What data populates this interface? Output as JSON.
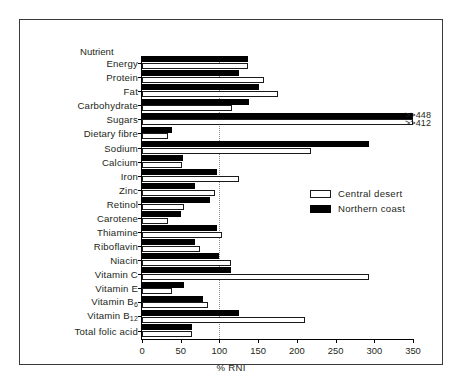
{
  "chart_data": {
    "type": "bar",
    "orientation": "horizontal",
    "title": "",
    "xlabel": "% RNI",
    "ylabel": "Nutrient",
    "xlim": [
      0,
      350
    ],
    "xticks": [
      0,
      50,
      100,
      150,
      200,
      250,
      300,
      350
    ],
    "grid": "vertical dotted reference line at 100",
    "reference_line": 100,
    "legend_position": "middle-right",
    "categories": [
      "Energy",
      "Protein",
      "Fat",
      "Carbohydrate",
      "Sugars",
      "Dietary fibre",
      "Sodium",
      "Calcium",
      "Iron",
      "Zinc",
      "Retinol",
      "Carotene",
      "Thiamine",
      "Riboflavin",
      "Niacin",
      "Vitamin C",
      "Vitamin E",
      "Vitamin B6",
      "Vitamin B12",
      "Total folic acid"
    ],
    "category_labels_html": [
      "Energy",
      "Protein",
      "Fat",
      "Carbohydrate",
      "Sugars",
      "Dietary fibre",
      "Sodium",
      "Calcium",
      "Iron",
      "Zinc",
      "Retinol",
      "Carotene",
      "Thiamine",
      "Riboflavin",
      "Niacin",
      "Vitamin C",
      "Vitamin E",
      "Vitamin B<sub>6</sub>",
      "Vitamin B<sub>12</sub>",
      "Total folic acid"
    ],
    "series": [
      {
        "name": "Northern coast",
        "color": "#000000",
        "style": "filled-black",
        "values": [
          137,
          125,
          151,
          138,
          448,
          39,
          293,
          53,
          97,
          69,
          88,
          50,
          97,
          69,
          99,
          115,
          54,
          79,
          125,
          64
        ]
      },
      {
        "name": "Central desert",
        "color": "#ffffff",
        "style": "open-white-outline",
        "values": [
          137,
          157,
          176,
          116,
          412,
          33,
          218,
          52,
          125,
          94,
          54,
          33,
          103,
          75,
          115,
          293,
          39,
          85,
          210,
          64
        ]
      }
    ],
    "annotations": [
      {
        "category": "Sugars",
        "series": "Northern coast",
        "text": ">>448"
      },
      {
        "category": "Sugars",
        "series": "Central desert",
        "text": ">>412"
      }
    ]
  },
  "legend": {
    "items": [
      {
        "label": "Central desert",
        "swatch": "white"
      },
      {
        "label": "Northern coast",
        "swatch": "black"
      }
    ]
  },
  "axes": {
    "x_title": "% RNI",
    "y_title": "Nutrient",
    "x_tick_labels": [
      "0",
      "50",
      "100",
      "150",
      "200",
      "250",
      "300",
      "350"
    ]
  }
}
